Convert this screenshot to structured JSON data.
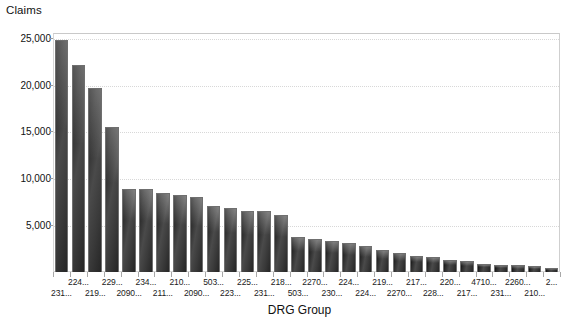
{
  "chart_data": {
    "type": "bar",
    "title": "",
    "ylabel": "Claims",
    "xlabel": "DRG Group",
    "ylim": [
      0,
      25500
    ],
    "yticks": [
      5000,
      10000,
      15000,
      20000,
      25000
    ],
    "ytick_labels": [
      "5,000",
      "10,000",
      "15,000",
      "20,000",
      "25,000"
    ],
    "grid": true,
    "legend": "none",
    "categories": [
      "231...",
      "224...",
      "219...",
      "229...",
      "2090...",
      "234...",
      "211...",
      "210...",
      "2090...",
      "503...",
      "223...",
      "225...",
      "231...",
      "218...",
      "503...",
      "2270...",
      "230...",
      "224...",
      "224...",
      "219...",
      "2270...",
      "217...",
      "228...",
      "220...",
      "217...",
      "4710...",
      "231...",
      "2260...",
      "210...",
      "2..."
    ],
    "category_rows": [
      1,
      0,
      1,
      0,
      1,
      0,
      1,
      0,
      1,
      0,
      1,
      0,
      1,
      0,
      1,
      0,
      1,
      0,
      1,
      0,
      1,
      0,
      1,
      0,
      1,
      0,
      1,
      0,
      1,
      0
    ],
    "values": [
      24800,
      22100,
      19600,
      15500,
      8900,
      8850,
      8450,
      8250,
      8050,
      7050,
      6800,
      6550,
      6500,
      6100,
      3700,
      3500,
      3300,
      3050,
      2750,
      2400,
      2000,
      1750,
      1600,
      1300,
      1150,
      900,
      800,
      700,
      600,
      450
    ]
  },
  "axes": {
    "y_title": "Claims",
    "x_title": "DRG Group"
  },
  "colors": {
    "bar_dark": "#1d1d1d",
    "bar_mid": "#4a4a4a",
    "bar_edge": "#6f6f6f",
    "grid": "#d8d8d8",
    "frame": "#d0d0d0",
    "text": "#111111",
    "background": "#ffffff"
  }
}
